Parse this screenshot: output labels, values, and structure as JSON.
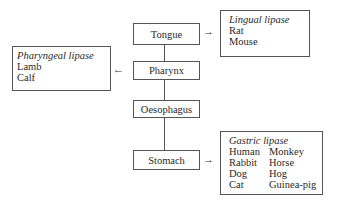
{
  "organs": [
    {
      "label": "Tongue"
    },
    {
      "label": "Pharynx"
    },
    {
      "label": "Oesophagus"
    },
    {
      "label": "Stomach"
    }
  ],
  "lipases": {
    "lingual": {
      "title": "Lingual lipase",
      "species": [
        "Rat",
        "Mouse"
      ],
      "source": "Tongue"
    },
    "pharyngeal": {
      "title": "Pharyngeal lipase",
      "species": [
        "Lamb",
        "Calf"
      ],
      "source": "Pharynx"
    },
    "gastric": {
      "title": "Gastric lipase",
      "species": [
        "Human",
        "Monkey",
        "Rabbit",
        "Horse",
        "Dog",
        "Hog",
        "Cat",
        "Guinea-pig"
      ],
      "source": "Stomach"
    }
  },
  "arrows": {
    "right": "→",
    "left": "←"
  }
}
